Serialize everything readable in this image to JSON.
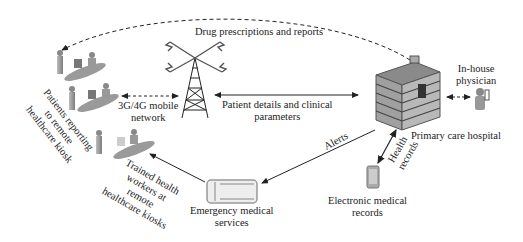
{
  "diagram": {
    "nodes": {
      "patients_kiosk": {
        "label_lines": [
          "Patients reporting",
          "to remote",
          "healthcare kiosk"
        ]
      },
      "trained_workers": {
        "label_lines": [
          "Trained health",
          "workers at",
          "remote",
          "healthcare kiosks"
        ]
      },
      "network": {
        "label_lines": [
          "3G/4G mobile",
          "network"
        ]
      },
      "hospital": {
        "label": "Primary care hospital"
      },
      "physician": {
        "label_lines": [
          "In-house",
          "physician"
        ]
      },
      "ems": {
        "label_lines": [
          "Emergency medical",
          "services"
        ]
      },
      "emr": {
        "label_lines": [
          "Electronic medical",
          "records"
        ]
      }
    },
    "edges": {
      "drug_prescriptions": {
        "label": "Drug prescriptions and reports",
        "style": "dashed"
      },
      "patient_details": {
        "label_lines": [
          "Patient details and clinical",
          "parameters"
        ],
        "style": "solid-bidirectional"
      },
      "alerts": {
        "label": "Alerts",
        "style": "solid"
      },
      "health_records": {
        "label_lines": [
          "Health",
          "records"
        ],
        "style": "solid-bidirectional"
      },
      "kiosk_network": {
        "style": "dashed-bidirectional"
      },
      "hospital_physician": {
        "style": "dashed-bidirectional"
      },
      "ems_to_kiosk": {
        "style": "solid"
      }
    },
    "colors": {
      "line": "#222222",
      "icon_gray": "#9a9a9a",
      "icon_dark": "#555555",
      "icon_light": "#cfcfcf"
    }
  }
}
